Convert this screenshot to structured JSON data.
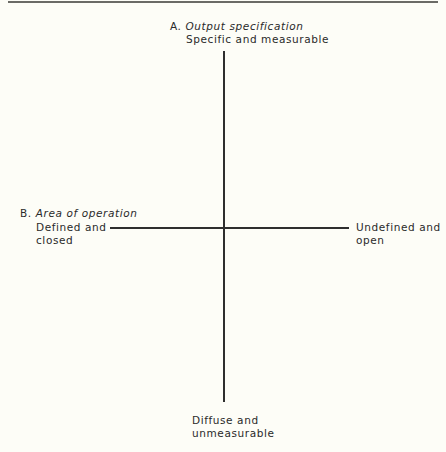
{
  "diagram": {
    "axis_a": {
      "prefix": "A.",
      "title": "Output specification",
      "top_pole": "Specific and measurable",
      "bottom_pole": [
        "Diffuse and",
        "unmeasurable"
      ]
    },
    "axis_b": {
      "prefix": "B.",
      "title": "Area of operation",
      "left_pole": [
        "Defined and",
        "closed"
      ],
      "right_pole": [
        "Undefined and",
        "open"
      ]
    }
  }
}
